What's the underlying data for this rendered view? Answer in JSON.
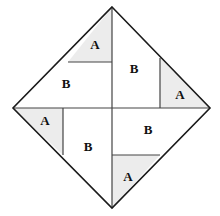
{
  "figure": {
    "background_color": "#ffffff",
    "outline_color": "#1a1a1a",
    "divider_color": "#444444",
    "shaded_fill": "#ececec",
    "unshaded_fill": "#ffffff",
    "outline_width": 1.6,
    "divider_width": 1.2,
    "canvas": {
      "width": 220,
      "height": 216
    },
    "vertices": {
      "top": {
        "x": 112,
        "y": 7
      },
      "right": {
        "x": 210,
        "y": 108
      },
      "bottom": {
        "x": 112,
        "y": 208
      },
      "left": {
        "x": 13,
        "y": 108
      },
      "center": {
        "x": 112,
        "y": 108
      }
    },
    "outline_path": "M112,7 L210,108 L112,208 L13,108 Z",
    "diagonals": [
      {
        "name": "vertical-diagonal",
        "path": "M112,7 L112,208"
      },
      {
        "name": "horizontal-diagonal",
        "path": "M13,108 L210,108"
      }
    ],
    "regions": [
      {
        "id": "top-left-a",
        "label": "A",
        "shaded": true,
        "path": "M68,62 L112,62 L112,7 Z",
        "label_x": 95,
        "label_y": 46
      },
      {
        "id": "top-left-b",
        "label": "B",
        "shaded": false,
        "path": "M13,108 L112,108 L112,62 L68,62 Z",
        "label_x": 66,
        "label_y": 85
      },
      {
        "id": "top-right-a",
        "label": "A",
        "shaded": true,
        "path": "M160,58 L160,108 L210,108 Z",
        "label_x": 180,
        "label_y": 96
      },
      {
        "id": "top-right-b",
        "label": "B",
        "shaded": false,
        "path": "M112,7 L160,58 L160,108 L112,108 Z",
        "label_x": 134,
        "label_y": 70
      },
      {
        "id": "bottom-left-a",
        "label": "A",
        "shaded": true,
        "path": "M13,108 L63,108 L63,155 Z",
        "label_x": 45,
        "label_y": 122
      },
      {
        "id": "bottom-left-b",
        "label": "B",
        "shaded": false,
        "path": "M63,108 L112,108 L112,208 L63,155 Z",
        "label_x": 88,
        "label_y": 148
      },
      {
        "id": "bottom-right-a",
        "label": "A",
        "shaded": true,
        "path": "M112,155 L160,155 L112,208 Z",
        "label_x": 128,
        "label_y": 178
      },
      {
        "id": "bottom-right-b",
        "label": "B",
        "shaded": false,
        "path": "M112,108 L210,108 L160,155 L112,155 Z",
        "label_x": 148,
        "label_y": 131
      }
    ],
    "dividers": [
      {
        "name": "top-left-divider",
        "path": "M68,62 L112,62"
      },
      {
        "name": "top-right-divider",
        "path": "M160,58 L160,108"
      },
      {
        "name": "bottom-left-divider",
        "path": "M63,108 L63,155"
      },
      {
        "name": "bottom-right-divider",
        "path": "M112,155 L160,155"
      }
    ]
  }
}
